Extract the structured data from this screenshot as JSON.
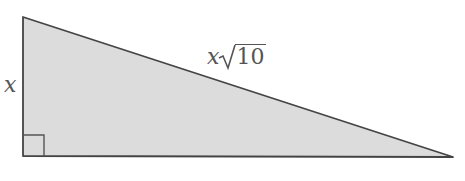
{
  "diagram": {
    "type": "right-triangle",
    "fill_color": "#dcdcdc",
    "stroke_color": "#444444",
    "vertices": {
      "top": [
        23,
        17
      ],
      "right_angle": [
        23,
        156
      ],
      "far": [
        453,
        157
      ]
    },
    "labels": {
      "vertical_leg": "x",
      "hypotenuse_var": "x",
      "hypotenuse_radicand": "10"
    },
    "right_angle_marker": true
  }
}
